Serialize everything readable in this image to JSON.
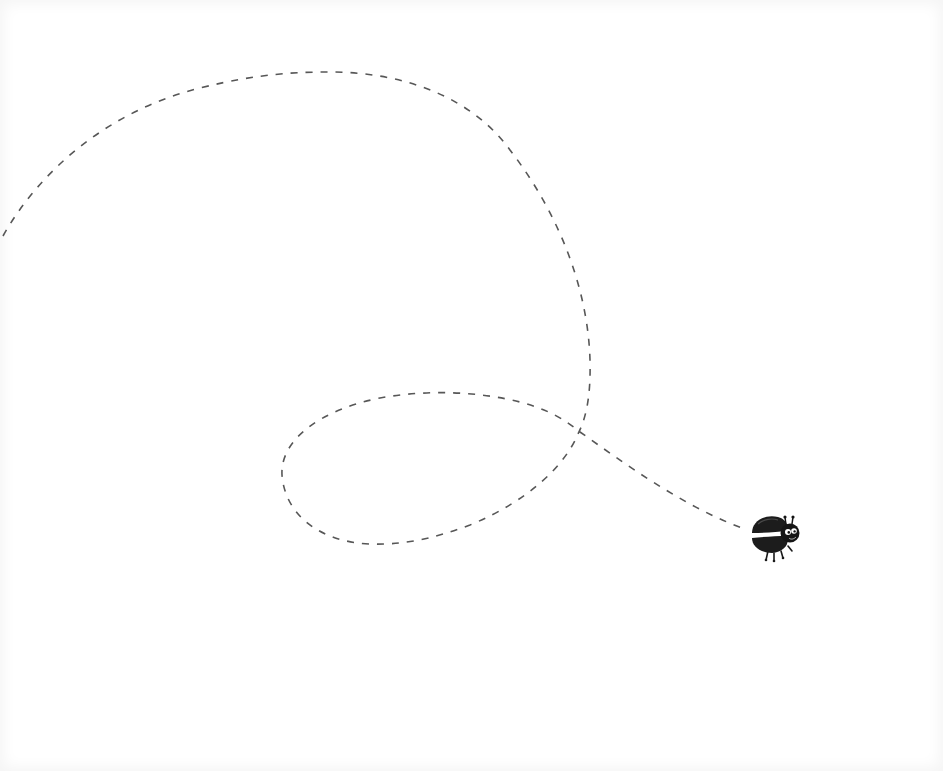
{
  "scene": {
    "description": "Cartoon black beetle flying along a looping dashed flight path on a white background",
    "background_color": "#ffffff",
    "path": {
      "style": "dashed",
      "stroke_color": "#555555",
      "dash_pattern": "7 8",
      "start": [
        3,
        235
      ],
      "end": [
        742,
        528
      ],
      "loops": 1
    },
    "character": {
      "type": "beetle",
      "color": "#1a1a1a",
      "position": [
        776,
        536
      ],
      "features": [
        "open wing shell",
        "two antennae",
        "big white eyes",
        "four legs"
      ]
    }
  }
}
